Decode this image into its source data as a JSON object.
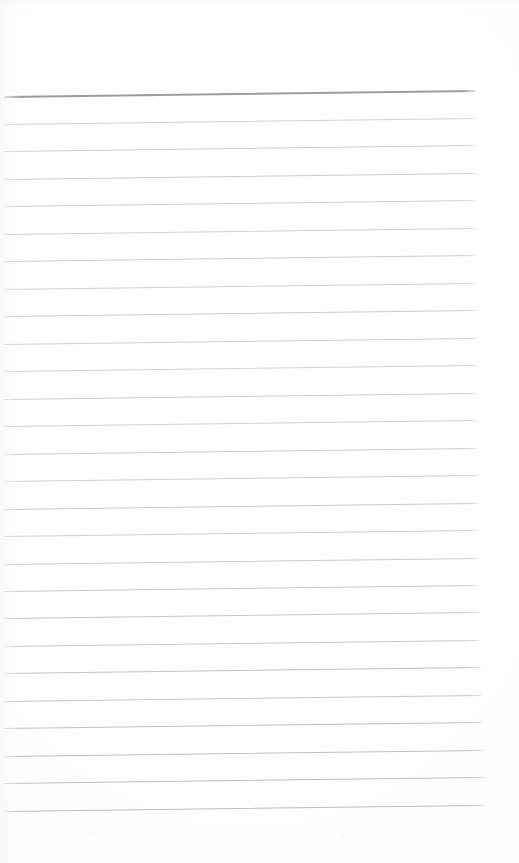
{
  "document": {
    "type": "scanned-document",
    "subtype": "blank-ruled-notebook-page",
    "title": "Scanned Ruled Notebook Page",
    "page_width": 519,
    "page_height": 863,
    "has_text_content": false,
    "handwriting_present": false,
    "printed_text_present": false,
    "orientation": "portrait"
  },
  "colors": {
    "page_background": "#fdfdfd",
    "paper_white": "#ffffff",
    "rule_light": "#c9c9cd",
    "rule_mid": "#bdbdc2",
    "rule_header": "#96969b",
    "rule_faint_tip": "#e3e3e6"
  },
  "layout": {
    "top_margin_px": 90,
    "bottom_margin_px": 50,
    "left_margin_px": 4,
    "right_margin_px": 40,
    "rule_spacing_px": 27.5,
    "rule_thickness_px": 1,
    "scan_skew_degrees": -0.72,
    "skew_direction": "lines rise toward the right"
  },
  "ruling": {
    "total_lines": 27,
    "header_rule_index": 0,
    "header_rule_note": "topmost rule is darker and thicker than the rest",
    "lines": [
      {
        "index": 0,
        "y_left": 96.5,
        "x_start": 4,
        "x_end": 476,
        "weight": "heavy",
        "color": "#96969b",
        "thickness": 1.6
      },
      {
        "index": 1,
        "y_left": 124.0,
        "x_start": 4,
        "x_end": 476,
        "weight": "light",
        "color": "#cbcbcf",
        "thickness": 1.0
      },
      {
        "index": 2,
        "y_left": 151.5,
        "x_start": 4,
        "x_end": 476,
        "weight": "light",
        "color": "#c6c6ca",
        "thickness": 1.0
      },
      {
        "index": 3,
        "y_left": 179.0,
        "x_start": 4,
        "x_end": 476,
        "weight": "light",
        "color": "#c2c2c7",
        "thickness": 1.0
      },
      {
        "index": 4,
        "y_left": 206.5,
        "x_start": 4,
        "x_end": 476,
        "weight": "light",
        "color": "#c6c6ca",
        "thickness": 1.0
      },
      {
        "index": 5,
        "y_left": 234.0,
        "x_start": 4,
        "x_end": 476,
        "weight": "light",
        "color": "#c9c9cd",
        "thickness": 1.0
      },
      {
        "index": 6,
        "y_left": 261.5,
        "x_start": 4,
        "x_end": 476,
        "weight": "light",
        "color": "#c4c4c9",
        "thickness": 1.0
      },
      {
        "index": 7,
        "y_left": 289.0,
        "x_start": 4,
        "x_end": 476,
        "weight": "light",
        "color": "#c8c8cc",
        "thickness": 1.0
      },
      {
        "index": 8,
        "y_left": 316.5,
        "x_start": 4,
        "x_end": 477,
        "weight": "light",
        "color": "#c2c2c7",
        "thickness": 1.0
      },
      {
        "index": 9,
        "y_left": 344.0,
        "x_start": 4,
        "x_end": 477,
        "weight": "light",
        "color": "#c6c6ca",
        "thickness": 1.0
      },
      {
        "index": 10,
        "y_left": 371.5,
        "x_start": 4,
        "x_end": 477,
        "weight": "light",
        "color": "#cbcbcf",
        "thickness": 1.0
      },
      {
        "index": 11,
        "y_left": 399.0,
        "x_start": 4,
        "x_end": 477,
        "weight": "light",
        "color": "#c4c4c9",
        "thickness": 1.0
      },
      {
        "index": 12,
        "y_left": 426.5,
        "x_start": 4,
        "x_end": 477,
        "weight": "light",
        "color": "#c8c8cc",
        "thickness": 1.0
      },
      {
        "index": 13,
        "y_left": 454.0,
        "x_start": 4,
        "x_end": 477,
        "weight": "light",
        "color": "#c2c2c7",
        "thickness": 1.0
      },
      {
        "index": 14,
        "y_left": 481.5,
        "x_start": 4,
        "x_end": 478,
        "weight": "light",
        "color": "#c6c6ca",
        "thickness": 1.0
      },
      {
        "index": 15,
        "y_left": 509.0,
        "x_start": 4,
        "x_end": 478,
        "weight": "light",
        "color": "#c0c0c5",
        "thickness": 1.0
      },
      {
        "index": 16,
        "y_left": 536.5,
        "x_start": 4,
        "x_end": 478,
        "weight": "light",
        "color": "#c6c6ca",
        "thickness": 1.0
      },
      {
        "index": 17,
        "y_left": 564.0,
        "x_start": 4,
        "x_end": 479,
        "weight": "light",
        "color": "#c2c2c7",
        "thickness": 1.0
      },
      {
        "index": 18,
        "y_left": 591.5,
        "x_start": 4,
        "x_end": 479,
        "weight": "light",
        "color": "#bebec3",
        "thickness": 1.1
      },
      {
        "index": 19,
        "y_left": 619.0,
        "x_start": 4,
        "x_end": 480,
        "weight": "light",
        "color": "#bcbcc1",
        "thickness": 1.1
      },
      {
        "index": 20,
        "y_left": 646.5,
        "x_start": 4,
        "x_end": 480,
        "weight": "light",
        "color": "#bebec3",
        "thickness": 1.1
      },
      {
        "index": 21,
        "y_left": 674.0,
        "x_start": 4,
        "x_end": 481,
        "weight": "light",
        "color": "#bababf",
        "thickness": 1.1
      },
      {
        "index": 22,
        "y_left": 701.5,
        "x_start": 4,
        "x_end": 482,
        "weight": "light",
        "color": "#bdbdc2",
        "thickness": 1.1
      },
      {
        "index": 23,
        "y_left": 729.0,
        "x_start": 4,
        "x_end": 483,
        "weight": "light",
        "color": "#b8b8bd",
        "thickness": 1.1
      },
      {
        "index": 24,
        "y_left": 756.5,
        "x_start": 4,
        "x_end": 484,
        "weight": "light",
        "color": "#b6b6bb",
        "thickness": 1.2
      },
      {
        "index": 25,
        "y_left": 784.0,
        "x_start": 4,
        "x_end": 485,
        "weight": "light",
        "color": "#b4b4b9",
        "thickness": 1.2
      },
      {
        "index": 26,
        "y_left": 811.5,
        "x_start": 4,
        "x_end": 485,
        "weight": "light",
        "color": "#b2b2b7",
        "thickness": 1.2
      }
    ]
  }
}
